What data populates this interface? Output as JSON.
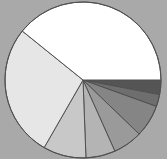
{
  "chart_data": {
    "type": "pie",
    "title": "",
    "legend": [],
    "background": "#a9a9a9",
    "start_angle_deg": 0,
    "direction": "clockwise",
    "center": [
      83,
      80
    ],
    "radius": 78,
    "slices": [
      {
        "label": "",
        "value": 3.0,
        "color": "#555555"
      },
      {
        "label": "",
        "value": 2.5,
        "color": "#6e6e6e"
      },
      {
        "label": "",
        "value": 6.7,
        "color": "#858585"
      },
      {
        "label": "",
        "value": 6.1,
        "color": "#9a9a9a"
      },
      {
        "label": "",
        "value": 6.1,
        "color": "#b4b4b4"
      },
      {
        "label": "",
        "value": 8.9,
        "color": "#c8c8c8"
      },
      {
        "label": "",
        "value": 27.5,
        "color": "#e6e6e6"
      },
      {
        "label": "",
        "value": 39.2,
        "color": "#ffffff"
      }
    ],
    "values": [
      3.0,
      2.5,
      6.7,
      6.1,
      6.1,
      8.9,
      27.5,
      39.2
    ],
    "categories": [
      "",
      "",
      "",
      "",
      "",
      "",
      "",
      ""
    ],
    "stroke_color": "#505050"
  }
}
